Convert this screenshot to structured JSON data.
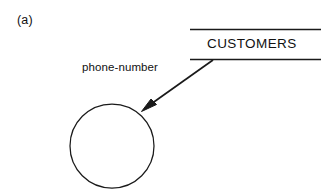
{
  "figure": {
    "part_label": "(a)",
    "background_color": "#ffffff",
    "stroke_color": "#1a1a1a"
  },
  "data_store": {
    "name": "CUSTOMERS",
    "shape": "open-ended-rectangle",
    "top_rule": {
      "x1": 190,
      "y1": 29,
      "x2": 321,
      "y2": 29
    },
    "bottom_rule": {
      "x1": 190,
      "y1": 59,
      "x2": 321,
      "y2": 59
    }
  },
  "process": {
    "shape": "circle",
    "label": "",
    "center_x": 112,
    "center_y": 146,
    "radius": 42
  },
  "data_flow": {
    "label": "phone-number",
    "direction": "data-store-to-process",
    "from_x": 213,
    "from_y": 60,
    "to_x": 143,
    "to_y": 110,
    "arrowhead": "filled-triangle"
  }
}
